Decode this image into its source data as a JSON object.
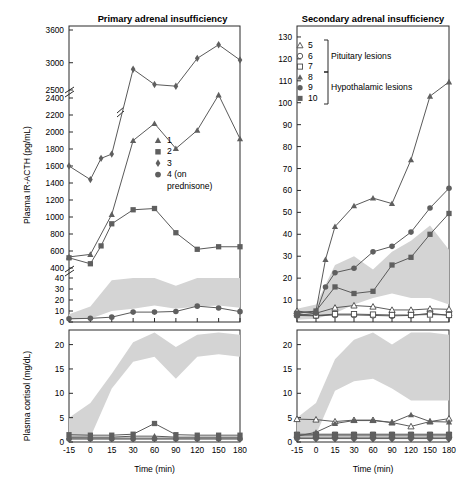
{
  "figure": {
    "width": 460,
    "height": 497,
    "xlabel": "Time (min)",
    "x_ticks": [
      "-15",
      "0",
      "15",
      "30",
      "60",
      "90",
      "120",
      "150",
      "180"
    ],
    "x_values": [
      -15,
      0,
      15,
      30,
      60,
      90,
      120,
      150,
      180
    ],
    "ylabel_top": "Plasma IR-ACTH (pg/mL)",
    "ylabel_bottom": "Plasma cortisol (mg/dL)",
    "band_legend": "shaded normal range"
  },
  "panels": {
    "left": {
      "title": "Primary adrenal insufficiency",
      "legend": [
        {
          "marker": "triangle-filled",
          "label": "1"
        },
        {
          "marker": "square-filled",
          "label": "2"
        },
        {
          "marker": "diamond-filled",
          "label": "3"
        },
        {
          "marker": "circle-filled",
          "label": "4 (on"
        },
        {
          "marker": "none",
          "label": "prednisone)"
        }
      ]
    },
    "right": {
      "title": "Secondary adrenal insufficiency",
      "legend": [
        {
          "marker": "triangle-open",
          "label": "5"
        },
        {
          "marker": "circle-open",
          "label": "6"
        },
        {
          "marker": "square-open",
          "label": "7"
        },
        {
          "marker": "triangle-filled",
          "label": "8"
        },
        {
          "marker": "circle-filled",
          "label": "9"
        },
        {
          "marker": "square-filled",
          "label": "10"
        }
      ],
      "group_labels": [
        "Pituitary lesions",
        "Hypothalamic lesions"
      ]
    }
  },
  "chart_data": [
    {
      "id": "primary-acth",
      "type": "line",
      "title": "Primary adrenal insufficiency",
      "xlabel": "Time (min)",
      "ylabel": "Plasma IR-ACTH (pg/mL)",
      "x": [
        -15,
        0,
        15,
        30,
        60,
        90,
        120,
        150,
        180
      ],
      "y_ticks": [
        0,
        10,
        20,
        30,
        40,
        400,
        600,
        800,
        1000,
        1200,
        1400,
        1600,
        1800,
        2000,
        2200,
        2400,
        2500,
        3000,
        3600
      ],
      "axis_breaks": [
        [
          40,
          400
        ],
        [
          2400,
          2500
        ]
      ],
      "series": [
        {
          "name": "1",
          "marker": "triangle-filled",
          "values": [
            530,
            560,
            1030,
            1900,
            2100,
            1805,
            2020,
            2410,
            1920
          ]
        },
        {
          "name": "2",
          "marker": "square-filled",
          "values": [
            520,
            450,
            660,
            920,
            1085,
            1100,
            815,
            620,
            650,
            650
          ]
        },
        {
          "name": "3",
          "marker": "diamond-filled",
          "values": [
            1600,
            1440,
            1690,
            1740,
            2880,
            2600,
            2570,
            3080,
            3330,
            3050
          ]
        },
        {
          "name": "4 (on prednisone)",
          "marker": "circle-filled",
          "values": [
            3,
            3.3,
            4.4,
            9,
            9,
            9.6,
            14.4,
            12.8,
            9.4
          ]
        }
      ]
    },
    {
      "id": "primary-cortisol",
      "type": "line",
      "title": "Primary adrenal insufficiency",
      "xlabel": "Time (min)",
      "ylabel": "Plasma cortisol (mg/dL)",
      "x": [
        -15,
        0,
        15,
        30,
        60,
        90,
        120,
        150,
        180
      ],
      "y_ticks": [
        0,
        5,
        10,
        15,
        20
      ],
      "ylim": [
        0,
        23
      ],
      "series": [
        {
          "name": "1",
          "marker": "triangle-filled",
          "values": [
            1.0,
            1.0,
            1.0,
            1.2,
            1.2,
            1.0,
            1.0,
            1.0,
            1.0
          ]
        },
        {
          "name": "2",
          "marker": "square-filled",
          "values": [
            1.5,
            1.4,
            1.4,
            1.6,
            3.8,
            1.5,
            1.4,
            1.4,
            1.4
          ]
        },
        {
          "name": "3",
          "marker": "diamond-filled",
          "values": [
            0.8,
            0.8,
            0.8,
            0.8,
            0.8,
            0.8,
            0.8,
            0.8,
            0.8
          ]
        },
        {
          "name": "4 (on prednisone)",
          "marker": "circle-filled",
          "values": [
            0.6,
            0.6,
            0.6,
            0.6,
            0.6,
            0.6,
            0.6,
            0.6,
            0.6
          ]
        }
      ],
      "normal_band": {
        "upper": [
          5.0,
          8.0,
          14.0,
          20.5,
          22.5,
          19.5,
          22.0,
          22.5,
          22.0
        ],
        "lower": [
          0.8,
          1.0,
          11.0,
          16.5,
          17.5,
          13.0,
          17.5,
          18.0,
          17.5
        ]
      }
    },
    {
      "id": "secondary-acth",
      "type": "line",
      "title": "Secondary adrenal insufficiency",
      "xlabel": "Time (min)",
      "ylabel": "Plasma IR-ACTH (pg/mL)",
      "x": [
        -15,
        0,
        15,
        30,
        60,
        90,
        120,
        150,
        180
      ],
      "y_ticks": [
        0,
        10,
        20,
        30,
        40,
        50,
        60,
        70,
        80,
        90,
        100,
        110,
        120,
        130
      ],
      "ylim": [
        0,
        135
      ],
      "series": [
        {
          "name": "5",
          "marker": "triangle-open",
          "values": [
            5.0,
            4.0,
            6.5,
            7.5,
            7.0,
            5.5,
            5.5,
            6.0,
            5.8
          ]
        },
        {
          "name": "6",
          "marker": "circle-open",
          "values": [
            3.0,
            2.8,
            3.2,
            3.2,
            3.0,
            2.8,
            3.0,
            4.0,
            3.0
          ]
        },
        {
          "name": "7",
          "marker": "square-open",
          "values": [
            3.5,
            3.0,
            3.6,
            3.6,
            3.4,
            3.2,
            3.2,
            3.4,
            3.2
          ]
        },
        {
          "name": "8",
          "marker": "triangle-filled",
          "values": [
            4.0,
            5.0,
            28.5,
            43.5,
            53.0,
            56.5,
            54.0,
            74.0,
            103.0,
            109.5
          ]
        },
        {
          "name": "9",
          "marker": "circle-filled",
          "values": [
            3.0,
            4.0,
            16.0,
            22.5,
            24.5,
            32.0,
            34.5,
            41.0,
            52.0,
            61.0
          ]
        },
        {
          "name": "10",
          "marker": "square-filled",
          "values": [
            4.0,
            5.0,
            16.0,
            13.0,
            14.0,
            26.0,
            29.5,
            40.0,
            49.5
          ]
        }
      ],
      "normal_band": {
        "upper": [
          6.0,
          8.0,
          26.0,
          30.0,
          24.0,
          32.0,
          37.0,
          44.0,
          33.0
        ],
        "lower": [
          1.0,
          1.5,
          4.0,
          8.0,
          11.0,
          13.0,
          11.0,
          11.0,
          8.0
        ]
      }
    },
    {
      "id": "secondary-cortisol",
      "type": "line",
      "title": "Secondary adrenal insufficiency",
      "xlabel": "Time (min)",
      "ylabel": "Plasma cortisol (mg/dL)",
      "x": [
        -15,
        0,
        15,
        30,
        60,
        90,
        120,
        150,
        180
      ],
      "y_ticks": [
        0,
        5,
        10,
        15,
        20
      ],
      "ylim": [
        0,
        23
      ],
      "series": [
        {
          "name": "5",
          "marker": "triangle-open",
          "values": [
            4.7,
            4.6,
            4.2,
            4.5,
            4.5,
            4.0,
            3.2,
            4.2,
            4.8
          ]
        },
        {
          "name": "6",
          "marker": "circle-open",
          "values": [
            1.0,
            1.0,
            1.0,
            1.0,
            1.0,
            1.0,
            1.0,
            1.0,
            1.0
          ]
        },
        {
          "name": "7",
          "marker": "square-open",
          "values": [
            1.4,
            1.4,
            1.4,
            1.4,
            1.4,
            1.4,
            1.4,
            1.4,
            1.4
          ]
        },
        {
          "name": "8",
          "marker": "triangle-filled",
          "values": [
            1.2,
            2.0,
            3.8,
            4.4,
            4.4,
            4.0,
            5.6,
            4.2,
            4.1
          ]
        },
        {
          "name": "9",
          "marker": "circle-filled",
          "values": [
            0.7,
            0.7,
            0.7,
            0.7,
            0.7,
            0.7,
            0.7,
            0.7,
            0.7
          ]
        },
        {
          "name": "10",
          "marker": "square-filled",
          "values": [
            1.6,
            1.6,
            1.6,
            1.6,
            1.6,
            1.6,
            1.6,
            1.6,
            1.6
          ]
        }
      ],
      "normal_band": {
        "upper": [
          5.0,
          8.0,
          17.0,
          21.0,
          22.5,
          20.0,
          22.5,
          22.5,
          22.0
        ],
        "lower": [
          1.2,
          1.5,
          10.5,
          12.5,
          13.0,
          11.0,
          8.5,
          8.5,
          8.5
        ]
      }
    }
  ]
}
